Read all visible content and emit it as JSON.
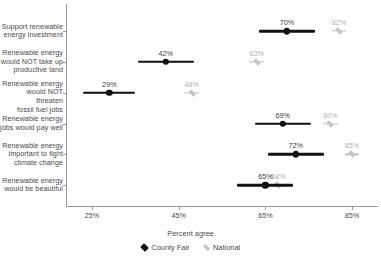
{
  "chart_data": {
    "type": "scatter",
    "title": "",
    "xlabel": "Percent agree",
    "ylabel": "",
    "xlim": [
      19,
      91
    ],
    "xticks": [
      25,
      45,
      65,
      85
    ],
    "xtick_labels": [
      "25%",
      "45%",
      "65%",
      "85%"
    ],
    "grid": false,
    "legend_position": "bottom",
    "categories": [
      "Support renewable\nenergy investment",
      "Renewable energy\nwould NOT take up\nproductive land",
      "Renewable energy\nwould NOT threaten\nfossil fuel jobs",
      "Renewable energy\njobs would pay well",
      "Renewable energy\nimportant to fight\nclimate change",
      "Renewable energy\nwould be beautiful"
    ],
    "series": [
      {
        "name": "County Fair",
        "color": "#111111",
        "values": [
          70,
          42,
          29,
          69,
          72,
          65
        ],
        "value_labels": [
          "70%",
          "42%",
          "29%",
          "69%",
          "72%",
          "65%"
        ],
        "ci_low": [
          63.5,
          35.5,
          23.0,
          62.5,
          65.5,
          58.5
        ],
        "ci_high": [
          76.5,
          48.5,
          35.0,
          75.5,
          78.5,
          71.5
        ]
      },
      {
        "name": "National",
        "color": "#c6c6c6",
        "values": [
          82,
          63,
          48,
          80,
          85,
          68
        ],
        "value_labels": [
          "82%",
          "63%",
          "48%",
          "80%",
          "85%",
          "68%"
        ],
        "ci_low": [
          80.3,
          61.3,
          46.3,
          78.3,
          83.3,
          66.3
        ],
        "ci_high": [
          83.7,
          64.7,
          49.7,
          81.7,
          86.7,
          69.7
        ]
      }
    ]
  },
  "legend": {
    "items": [
      {
        "label": "County Fair",
        "marker": "diamond-icon"
      },
      {
        "label": "National",
        "marker": "diamond-icon"
      }
    ]
  }
}
